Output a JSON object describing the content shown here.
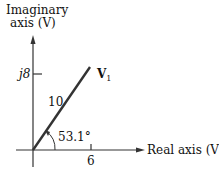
{
  "diagram": {
    "y_axis_label_line1": "Imaginary",
    "y_axis_label_line2": "axis (V)",
    "x_axis_label": "Real axis (V)",
    "y_tick_label": "j8",
    "x_tick_label": "6",
    "vector_label": "V",
    "vector_subscript": "1",
    "magnitude_label": "10",
    "angle_label": "53.1°"
  }
}
